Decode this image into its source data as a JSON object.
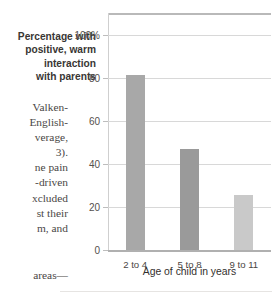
{
  "page": {
    "body_text_lines": [
      "Valken-",
      "English-",
      "verage,",
      "3).",
      "ne pain",
      "-driven",
      "xcluded",
      "st their",
      "m, and"
    ],
    "tail_text_lines": [
      "areas—"
    ]
  },
  "chart_data": {
    "type": "bar",
    "title": "",
    "categories": [
      "2 to 4",
      "5 to 8",
      "9 to 11"
    ],
    "values": [
      81,
      47,
      25.5
    ],
    "xlabel": "Age of child in years",
    "ylabel": "Percentage with positive, warm interaction with parents",
    "ylabel_lines": [
      "Percentage with",
      "positive, warm",
      "interaction",
      "with parents"
    ],
    "ylim": [
      0,
      110
    ],
    "yticks": [
      0,
      20,
      40,
      60,
      80,
      100
    ],
    "ytick_labels": [
      "0",
      "20",
      "40",
      "60",
      "80",
      "100%"
    ],
    "grid": true,
    "legend": "none",
    "bar_colors": [
      "#a8a8a8",
      "#9a9a9a",
      "#c9c9c9"
    ],
    "gridline_color": "#d8d8d8",
    "frame_color": "#b9b9b9"
  }
}
